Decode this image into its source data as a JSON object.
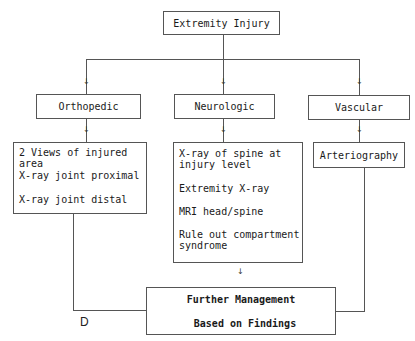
{
  "diagram": {
    "root": {
      "label": "Extremity Injury"
    },
    "categories": [
      {
        "label": "Orthopedic",
        "items": [
          "2 Views of injured area",
          "X-ray joint proximal",
          "X-ray joint distal"
        ]
      },
      {
        "label": "Neurologic",
        "items": [
          "X-ray of spine at\ninjury level",
          "Extremity X-ray",
          "MRI head/spine",
          "Rule out compartment\nsyndrome"
        ]
      },
      {
        "label": "Vascular",
        "items": [
          "Arteriography"
        ]
      }
    ],
    "outcome": {
      "line1": "Further Management",
      "line2": "Based on Findings"
    },
    "panel_letter": "D",
    "arrow_glyph": "↓",
    "colors": {
      "line": "#555555",
      "text": "#1a1a1a",
      "background": "#ffffff"
    }
  }
}
